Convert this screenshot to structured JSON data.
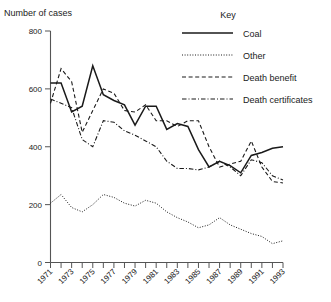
{
  "chart_data": {
    "type": "line",
    "title": "",
    "ylabel": "Number of cases",
    "xlabel": "",
    "ylim": [
      0,
      800
    ],
    "yticks": [
      0,
      200,
      400,
      600,
      800
    ],
    "xlim": [
      1971,
      1993
    ],
    "grid": false,
    "legend_position": "top-right",
    "legend_title": "Key",
    "x": [
      1971,
      1972,
      1973,
      1974,
      1975,
      1976,
      1977,
      1978,
      1979,
      1980,
      1981,
      1982,
      1983,
      1984,
      1985,
      1986,
      1987,
      1988,
      1989,
      1990,
      1991,
      1992,
      1993
    ],
    "xticks": [
      1971,
      1972,
      1973,
      1974,
      1975,
      1976,
      1977,
      1978,
      1979,
      1980,
      1981,
      1982,
      1983,
      1984,
      1985,
      1986,
      1987,
      1988,
      1989,
      1990,
      1991,
      1992,
      1993
    ],
    "xtick_labels": [
      "1971",
      "",
      "1973",
      "",
      "1975",
      "",
      "1977",
      "",
      "1979",
      "",
      "1981",
      "",
      "1983",
      "",
      "1985",
      "",
      "1987",
      "",
      "1989",
      "",
      "1991",
      "",
      "1993"
    ],
    "series": [
      {
        "name": "Coal",
        "style": "solid",
        "values": [
          620,
          620,
          520,
          540,
          680,
          580,
          560,
          545,
          475,
          540,
          540,
          460,
          480,
          470,
          390,
          330,
          350,
          335,
          310,
          370,
          380,
          395,
          400
        ]
      },
      {
        "name": "Other",
        "style": "dotted",
        "values": [
          205,
          235,
          190,
          175,
          200,
          235,
          225,
          205,
          195,
          215,
          205,
          175,
          155,
          140,
          120,
          130,
          155,
          130,
          115,
          100,
          90,
          65,
          75
        ]
      },
      {
        "name": "Death benefit",
        "style": "dashed",
        "values": [
          550,
          670,
          625,
          450,
          525,
          600,
          585,
          525,
          520,
          545,
          490,
          490,
          470,
          490,
          490,
          400,
          330,
          340,
          350,
          420,
          330,
          280,
          275
        ]
      },
      {
        "name": "Death certificates",
        "style": "dashdot",
        "values": [
          565,
          550,
          535,
          425,
          400,
          490,
          485,
          455,
          440,
          420,
          400,
          350,
          325,
          325,
          320,
          330,
          350,
          330,
          300,
          355,
          345,
          300,
          285
        ]
      }
    ]
  },
  "legend": {
    "title": "Key",
    "items": [
      {
        "label": "Coal",
        "style": "solid"
      },
      {
        "label": "Other",
        "style": "dotted"
      },
      {
        "label": "Death benefit",
        "style": "dashed"
      },
      {
        "label": "Death certificates",
        "style": "dashdot"
      }
    ]
  },
  "colors": {
    "line": "#1a1a1a",
    "axis": "#555555",
    "background": "#ffffff"
  }
}
